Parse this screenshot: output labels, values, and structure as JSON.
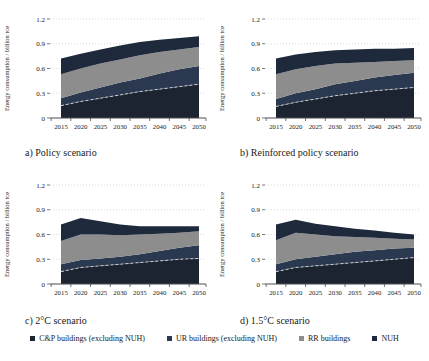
{
  "figure_title": "Energy consumption scenarios for buildings",
  "legend": {
    "items": [
      {
        "label": "C&P buildings (excluding NUH)",
        "color": "#1c2331"
      },
      {
        "label": "UR buildings (excluding NUH)",
        "color": "#2a3850"
      },
      {
        "label": "RR buildings",
        "color": "#8d8d8d"
      },
      {
        "label": "NUH",
        "color": "#1e2a3c"
      }
    ]
  },
  "chart_data": [
    {
      "type": "area",
      "stacked": true,
      "title": "a) Policy scenario",
      "xlabel": "",
      "ylabel": "Energy consumption / billion tce",
      "x": [
        2015,
        2020,
        2025,
        2030,
        2035,
        2040,
        2045,
        2050
      ],
      "ylim": [
        0,
        1.2
      ],
      "yticks": [
        0,
        0.3,
        0.6,
        0.9,
        1.2
      ],
      "grid": "dotted-horizontal",
      "legend_position": "none",
      "series": [
        {
          "name": "C&P buildings (excluding NUH)",
          "color": "#1c2331",
          "values": [
            0.15,
            0.2,
            0.24,
            0.28,
            0.32,
            0.35,
            0.38,
            0.41
          ]
        },
        {
          "name": "UR buildings (excluding NUH)",
          "color": "#2a3850",
          "values": [
            0.09,
            0.11,
            0.13,
            0.15,
            0.16,
            0.19,
            0.21,
            0.22
          ]
        },
        {
          "name": "RR buildings",
          "color": "#8d8d8d",
          "values": [
            0.29,
            0.29,
            0.29,
            0.28,
            0.28,
            0.26,
            0.24,
            0.23
          ]
        },
        {
          "name": "NUH",
          "color": "#1e2a3c",
          "values": [
            0.19,
            0.18,
            0.17,
            0.17,
            0.16,
            0.15,
            0.14,
            0.13
          ]
        }
      ],
      "separator": {
        "after_series": 0,
        "style": "dashed",
        "color": "#d8d8d8"
      }
    },
    {
      "type": "area",
      "stacked": true,
      "title": "b) Reinforced policy scenario",
      "xlabel": "",
      "ylabel": "Energy consumption / billion tce",
      "x": [
        2015,
        2020,
        2025,
        2030,
        2035,
        2040,
        2045,
        2050
      ],
      "ylim": [
        0,
        1.2
      ],
      "yticks": [
        0,
        0.3,
        0.6,
        0.9,
        1.2
      ],
      "grid": "dotted-horizontal",
      "legend_position": "none",
      "series": [
        {
          "name": "C&P buildings (excluding NUH)",
          "color": "#1c2331",
          "values": [
            0.14,
            0.19,
            0.23,
            0.27,
            0.3,
            0.33,
            0.35,
            0.37
          ]
        },
        {
          "name": "UR buildings (excluding NUH)",
          "color": "#2a3850",
          "values": [
            0.09,
            0.11,
            0.12,
            0.14,
            0.15,
            0.16,
            0.17,
            0.18
          ]
        },
        {
          "name": "RR buildings",
          "color": "#8d8d8d",
          "values": [
            0.3,
            0.29,
            0.28,
            0.25,
            0.22,
            0.19,
            0.17,
            0.15
          ]
        },
        {
          "name": "NUH",
          "color": "#1e2a3c",
          "values": [
            0.19,
            0.18,
            0.17,
            0.16,
            0.16,
            0.16,
            0.15,
            0.15
          ]
        }
      ],
      "separator": {
        "after_series": 0,
        "style": "dashed",
        "color": "#d8d8d8"
      }
    },
    {
      "type": "area",
      "stacked": true,
      "title": "c) 2°C scenario",
      "xlabel": "",
      "ylabel": "Energy consumption / billion tce",
      "x": [
        2015,
        2020,
        2025,
        2030,
        2035,
        2040,
        2045,
        2050
      ],
      "ylim": [
        0,
        1.2
      ],
      "yticks": [
        0,
        0.3,
        0.6,
        0.9,
        1.2
      ],
      "grid": "dotted-horizontal",
      "legend_position": "none",
      "series": [
        {
          "name": "C&P buildings (excluding NUH)",
          "color": "#1c2331",
          "values": [
            0.15,
            0.2,
            0.22,
            0.24,
            0.26,
            0.28,
            0.3,
            0.31
          ]
        },
        {
          "name": "UR buildings (excluding NUH)",
          "color": "#2a3850",
          "values": [
            0.09,
            0.09,
            0.09,
            0.09,
            0.1,
            0.12,
            0.14,
            0.16
          ]
        },
        {
          "name": "RR buildings",
          "color": "#8d8d8d",
          "values": [
            0.28,
            0.31,
            0.29,
            0.26,
            0.24,
            0.21,
            0.18,
            0.17
          ]
        },
        {
          "name": "NUH",
          "color": "#1e2a3c",
          "values": [
            0.2,
            0.2,
            0.16,
            0.13,
            0.1,
            0.09,
            0.08,
            0.06
          ]
        }
      ],
      "separator": {
        "after_series": 0,
        "style": "dashed",
        "color": "#d8d8d8"
      }
    },
    {
      "type": "area",
      "stacked": true,
      "title": "d) 1.5°C scenario",
      "xlabel": "",
      "ylabel": "Energy consumption / billion tce",
      "x": [
        2015,
        2020,
        2025,
        2030,
        2035,
        2040,
        2045,
        2050
      ],
      "ylim": [
        0,
        1.2
      ],
      "yticks": [
        0,
        0.3,
        0.6,
        0.9,
        1.2
      ],
      "grid": "dotted-horizontal",
      "legend_position": "none",
      "series": [
        {
          "name": "C&P buildings (excluding NUH)",
          "color": "#1c2331",
          "values": [
            0.15,
            0.2,
            0.22,
            0.24,
            0.26,
            0.28,
            0.3,
            0.32
          ]
        },
        {
          "name": "UR buildings (excluding NUH)",
          "color": "#2a3850",
          "values": [
            0.09,
            0.1,
            0.11,
            0.12,
            0.13,
            0.13,
            0.13,
            0.12
          ]
        },
        {
          "name": "RR buildings",
          "color": "#8d8d8d",
          "values": [
            0.29,
            0.32,
            0.27,
            0.22,
            0.18,
            0.15,
            0.12,
            0.1
          ]
        },
        {
          "name": "NUH",
          "color": "#1e2a3c",
          "values": [
            0.19,
            0.16,
            0.13,
            0.12,
            0.1,
            0.09,
            0.07,
            0.06
          ]
        }
      ],
      "separator": {
        "after_series": 0,
        "style": "dashed",
        "color": "#d8d8d8"
      }
    }
  ]
}
